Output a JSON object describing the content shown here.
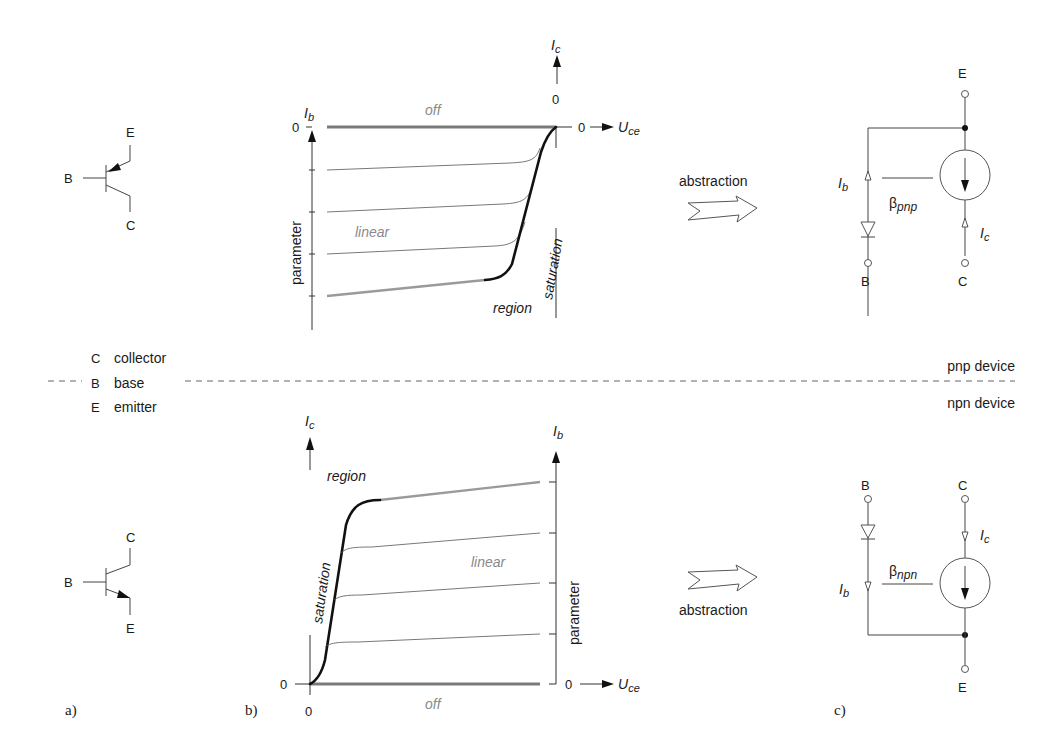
{
  "panels": {
    "a": "a)",
    "b": "b)",
    "c": "c)"
  },
  "legend": {
    "items": [
      {
        "letter": "C",
        "text": "collector"
      },
      {
        "letter": "B",
        "text": "base"
      },
      {
        "letter": "E",
        "text": "emitter"
      }
    ]
  },
  "devices": {
    "pnp": "pnp device",
    "npn": "npn device"
  },
  "symbols": {
    "pnp": {
      "E": "E",
      "B": "B",
      "C": "C"
    },
    "npn": {
      "C": "C",
      "B": "B",
      "E": "E"
    }
  },
  "charts": {
    "pnp": {
      "ib_axis": "I",
      "ib_sub": "b",
      "ic_axis": "I",
      "ic_sub": "c",
      "uce_axis": "U",
      "uce_sub": "ce",
      "zero_ib": "0",
      "zero_ic": "0",
      "zero_uce": "0",
      "parameter": "parameter",
      "off": "off",
      "linear": "linear",
      "saturation": "saturation",
      "region": "region"
    },
    "npn": {
      "ic_axis": "I",
      "ic_sub": "c",
      "ib_axis": "I",
      "ib_sub": "b",
      "uce_axis": "U",
      "uce_sub": "ce",
      "zero_ic": "0",
      "zero_x": "0",
      "zero_ib": "0",
      "parameter": "parameter",
      "off": "off",
      "linear": "linear",
      "saturation": "saturation",
      "region": "region"
    }
  },
  "abstraction": {
    "label": "abstraction"
  },
  "circuits": {
    "pnp": {
      "E": "E",
      "B": "B",
      "C": "C",
      "Ib": "I",
      "Ib_sub": "b",
      "Ic": "I",
      "Ic_sub": "c",
      "beta": "β",
      "beta_sub": "pnp"
    },
    "npn": {
      "B": "B",
      "C": "C",
      "E": "E",
      "Ib": "I",
      "Ib_sub": "b",
      "Ic": "I",
      "Ic_sub": "c",
      "beta": "β",
      "beta_sub": "npn"
    }
  }
}
